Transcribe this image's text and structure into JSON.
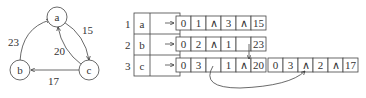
{
  "graph": {
    "nodes": [
      {
        "id": "a",
        "label": "a",
        "cx": 57,
        "cy": 17
      },
      {
        "id": "b",
        "label": "b",
        "cx": 20,
        "cy": 70
      },
      {
        "id": "c",
        "label": "c",
        "cx": 89,
        "cy": 70
      }
    ],
    "edges": [
      {
        "from": "a",
        "to": "c",
        "weight": "15"
      },
      {
        "from": "b",
        "to": "a",
        "weight": "23"
      },
      {
        "from": "c",
        "to": "a",
        "weight": "20"
      },
      {
        "from": "c",
        "to": "b",
        "weight": "17"
      }
    ]
  },
  "vertex_table": {
    "rows": [
      {
        "index": "1",
        "vertex": "a"
      },
      {
        "index": "2",
        "vertex": "b"
      },
      {
        "index": "3",
        "vertex": "c"
      }
    ]
  },
  "edge_lists": {
    "row1": [
      [
        "0",
        "1",
        "∧",
        "3",
        "∧",
        "15"
      ]
    ],
    "row2": [
      [
        "0",
        "2",
        "∧",
        "1",
        "",
        "23"
      ]
    ],
    "row3": [
      [
        "0",
        "3",
        "",
        "1",
        "∧",
        "20"
      ],
      [
        "0",
        "3",
        "∧",
        "2",
        "∧",
        "17"
      ]
    ]
  },
  "null_symbol": "∧"
}
